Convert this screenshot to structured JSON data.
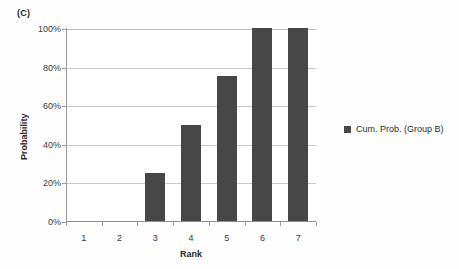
{
  "figure": {
    "panel_label": "(C)",
    "background_color": "#ffffff"
  },
  "chart_data": {
    "type": "bar",
    "title": "(C)",
    "subtitle": "",
    "xlabel": "Rank",
    "ylabel": "Probability",
    "categories": [
      "1",
      "2",
      "3",
      "4",
      "5",
      "6",
      "7"
    ],
    "values": [
      0,
      0,
      25,
      50,
      75,
      100,
      100
    ],
    "value_unit": "%",
    "ylim": [
      0,
      100
    ],
    "ytick_labels": [
      "0%",
      "20%",
      "40%",
      "60%",
      "80%",
      "100%"
    ],
    "ytick_values": [
      0,
      20,
      40,
      60,
      80,
      100
    ],
    "grid": "horizontal",
    "legend_position": "right",
    "series": [
      {
        "name": "Cum. Prob. (Group B)",
        "color": "#474747",
        "values": [
          0,
          0,
          25,
          50,
          75,
          100,
          100
        ]
      }
    ],
    "annotations": []
  },
  "axes": {
    "y": {
      "label": "Probability",
      "ticks": [
        {
          "label": "100%",
          "value": 100
        },
        {
          "label": "80%",
          "value": 80
        },
        {
          "label": "60%",
          "value": 60
        },
        {
          "label": "40%",
          "value": 40
        },
        {
          "label": "20%",
          "value": 20
        },
        {
          "label": "0%",
          "value": 0
        }
      ]
    },
    "x": {
      "label": "Rank",
      "ticks": [
        {
          "label": "1"
        },
        {
          "label": "2"
        },
        {
          "label": "3"
        },
        {
          "label": "4"
        },
        {
          "label": "5"
        },
        {
          "label": "6"
        },
        {
          "label": "7"
        }
      ]
    }
  },
  "legend": {
    "items": [
      {
        "label": "Cum. Prob. (Group B)",
        "color": "#474747",
        "marker": "square-marker"
      }
    ]
  },
  "colors": {
    "bar": "#474747",
    "gridline": "#c9c9c9",
    "axis": "#9a9a9a",
    "text": "#2b2b2b"
  }
}
